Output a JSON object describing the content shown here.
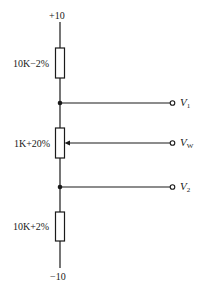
{
  "diagram": {
    "type": "voltage-divider-potentiometer",
    "supply_top": "+10",
    "supply_bottom": "−10",
    "components": [
      {
        "id": "R1",
        "kind": "resistor",
        "label": "10K−2%"
      },
      {
        "id": "RP",
        "kind": "potentiometer",
        "label": "1K+20%"
      },
      {
        "id": "R2",
        "kind": "resistor",
        "label": "10K+2%"
      }
    ],
    "outputs": [
      {
        "id": "V1",
        "symbol": "V",
        "subscript": "1"
      },
      {
        "id": "VW",
        "symbol": "V",
        "subscript": "W"
      },
      {
        "id": "V2",
        "symbol": "V",
        "subscript": "2"
      }
    ],
    "colors": {
      "line": "#1a1a1a",
      "background": "#ffffff"
    }
  }
}
